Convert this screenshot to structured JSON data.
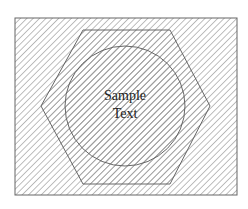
{
  "diagram": {
    "label_lines": [
      "Sample",
      "Text"
    ],
    "colors": {
      "background": "#ffffff",
      "hatch": "#9a9a9a",
      "outline": "#666666",
      "text": "#222222"
    },
    "shapes": {
      "outer_rect": {
        "x": 15,
        "y": 18,
        "width": 222,
        "height": 177
      },
      "hexagon_points": "83,30 170,30 210,106 170,184 83,184 41,106",
      "circle": {
        "cx": 125,
        "cy": 106,
        "r": 60
      }
    }
  }
}
